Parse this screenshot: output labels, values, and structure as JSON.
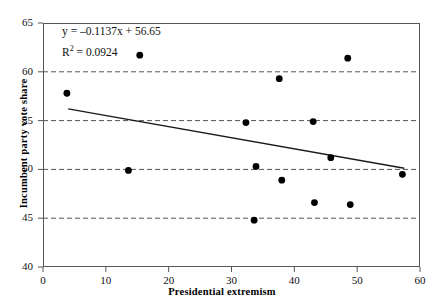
{
  "chart_data": {
    "type": "scatter",
    "title": "",
    "xlabel": "Presidential extremism",
    "ylabel": "Incumbent party vote share",
    "xlim": [
      0,
      60
    ],
    "ylim": [
      40,
      65
    ],
    "xticks": [
      0,
      10,
      20,
      30,
      40,
      50,
      60
    ],
    "yticks": [
      40,
      45,
      50,
      55,
      60,
      65
    ],
    "grid": "horizontal-dashed",
    "legend": "none",
    "points": [
      {
        "x": 3.8,
        "y": 57.8
      },
      {
        "x": 13.6,
        "y": 49.9
      },
      {
        "x": 15.4,
        "y": 61.7
      },
      {
        "x": 32.3,
        "y": 54.8
      },
      {
        "x": 33.6,
        "y": 44.8
      },
      {
        "x": 33.9,
        "y": 50.3
      },
      {
        "x": 37.6,
        "y": 59.3
      },
      {
        "x": 38.0,
        "y": 48.9
      },
      {
        "x": 43.0,
        "y": 54.9
      },
      {
        "x": 43.2,
        "y": 46.6
      },
      {
        "x": 45.8,
        "y": 51.2
      },
      {
        "x": 48.5,
        "y": 61.4
      },
      {
        "x": 48.9,
        "y": 46.4
      },
      {
        "x": 57.2,
        "y": 49.5
      }
    ],
    "trendline": {
      "slope": -0.1137,
      "intercept": 56.65,
      "x_start": 4.0,
      "x_end": 57.5,
      "equation_label": "y = –0.1137x + 56.65",
      "r_squared_label_prefix": "R",
      "r_squared_label_sup": "2",
      "r_squared_label_value": " = 0.0924",
      "r_squared": 0.0924
    },
    "colors": {
      "point": "#000000",
      "trendline": "#1a1a1a",
      "gridline": "#555555",
      "axis": "#555555",
      "background": "#ffffff"
    }
  }
}
